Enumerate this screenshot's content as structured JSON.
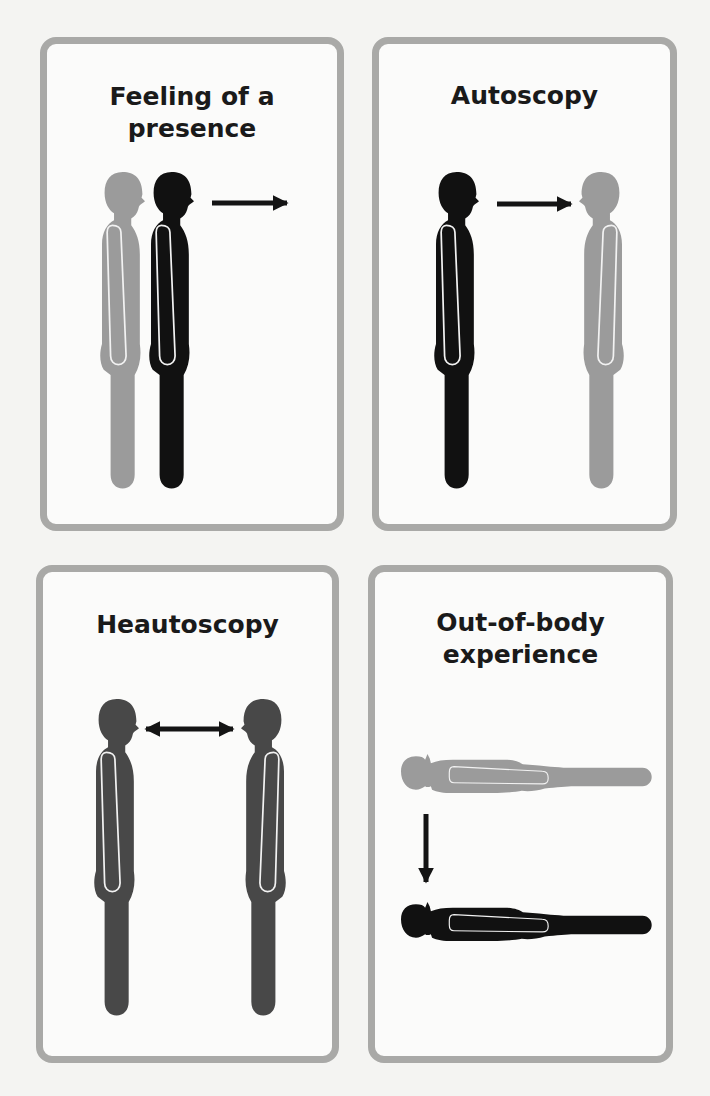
{
  "panels": [
    {
      "id": "feeling-of-a-presence",
      "title": "Feeling of a\npresence",
      "figures": [
        "gray standing figure (behind)",
        "black standing figure (self)"
      ],
      "arrow": "right"
    },
    {
      "id": "autoscopy",
      "title": "Autoscopy",
      "figures": [
        "black standing figure (self)",
        "gray standing figure (double)"
      ],
      "arrow": "right"
    },
    {
      "id": "heautoscopy",
      "title": "Heautoscopy",
      "figures": [
        "dark gray standing figure",
        "dark gray standing figure (mirrored)"
      ],
      "arrow": "double-horizontal"
    },
    {
      "id": "out-of-body-experience",
      "title": "Out-of-body\nexperience",
      "figures": [
        "gray lying figure (elevated)",
        "black lying figure (body)"
      ],
      "arrow": "down"
    }
  ],
  "colors": {
    "border": "#a9a9a7",
    "self": "#111111",
    "double": "#9b9b9b",
    "heautoscopy": "#484848",
    "arrow": "#141414",
    "outline": "#f2f2f2"
  }
}
